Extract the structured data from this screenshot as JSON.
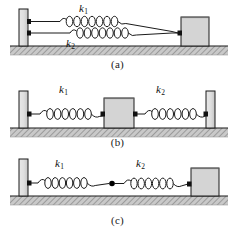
{
  "figure": {
    "background": "#ffffff",
    "colors": {
      "line": "#1a1a1a",
      "wall_fill": "#d9d9d9",
      "block_fill": "#d4d4d4",
      "ground_fill": "#c9c9c9",
      "hatch": "#8a8a8a",
      "node": "#000000"
    }
  },
  "panels": [
    {
      "id": "a",
      "caption": "(a)",
      "arrangement": "parallel",
      "labels": [
        {
          "id": "a-k1",
          "symbol": "k",
          "subscript": "1",
          "position": "above-upper-spring"
        },
        {
          "id": "a-k2",
          "symbol": "k",
          "subscript": "2",
          "position": "below-lower-spring"
        }
      ],
      "elements": {
        "wall": "left-wall",
        "springs": [
          "spring-k1",
          "spring-k2"
        ],
        "block": "block-mass",
        "ground": "hatched-ground",
        "anchors": [
          "wall-anchor-upper",
          "wall-anchor-lower",
          "block-anchor"
        ]
      }
    },
    {
      "id": "b",
      "caption": "(b)",
      "arrangement": "block-between-two-walls",
      "labels": [
        {
          "id": "b-k1",
          "symbol": "k",
          "subscript": "1",
          "position": "above-left-spring"
        },
        {
          "id": "b-k2",
          "symbol": "k",
          "subscript": "2",
          "position": "above-right-spring"
        }
      ],
      "elements": {
        "walls": [
          "left-wall",
          "right-wall"
        ],
        "springs": [
          "spring-k1",
          "spring-k2"
        ],
        "block": "block-mass",
        "ground": "hatched-ground",
        "anchors": [
          "left-wall-anchor",
          "block-anchor-left",
          "block-anchor-right",
          "right-wall-anchor"
        ]
      }
    },
    {
      "id": "c",
      "caption": "(c)",
      "arrangement": "series",
      "labels": [
        {
          "id": "c-k1",
          "symbol": "k",
          "subscript": "1",
          "position": "above-left-spring"
        },
        {
          "id": "c-k2",
          "symbol": "k",
          "subscript": "2",
          "position": "above-right-spring"
        }
      ],
      "elements": {
        "wall": "left-wall",
        "springs": [
          "spring-k1",
          "spring-k2"
        ],
        "junction": "series-junction-node",
        "block": "block-mass",
        "ground": "hatched-ground",
        "anchors": [
          "wall-anchor",
          "block-anchor"
        ]
      }
    }
  ]
}
